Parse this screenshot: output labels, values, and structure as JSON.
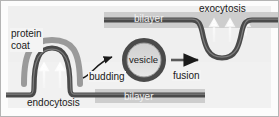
{
  "figure": {
    "labels": {
      "protein_coat_line1": "protein",
      "protein_coat_line2": "coat",
      "endocytosis": "endocytosis",
      "budding": "budding",
      "vesicle": "vesicle",
      "fusion": "fusion",
      "exocytosis": "exocytosis",
      "bilayer_top": "bilayer",
      "bilayer_bottom": "bilayer"
    },
    "colors": {
      "background": "#fcfcfc",
      "panel_shade": "#d8d8d8",
      "membrane_dark": "#4a4a4a",
      "membrane_mid": "#6e6e6e",
      "protein_coat": "#9a9a9a",
      "vesicle_fill": "#b8b8b8",
      "arrow_white": "#f0f0f0",
      "arrow_dark": "#1a1a1a",
      "label_text": "#1a1a1a",
      "label_text_light": "#f2f2f2",
      "border": "#b0b0b0"
    }
  }
}
